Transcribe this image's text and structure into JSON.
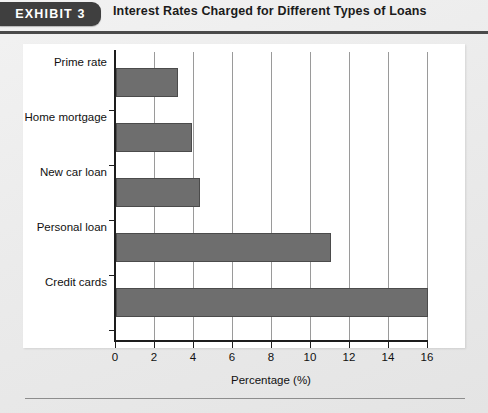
{
  "header": {
    "badge_label": "EXHIBIT 3",
    "title": "Interest Rates Charged for Different Types of Loans"
  },
  "colors": {
    "badge_background": "#3f3f3f",
    "badge_text": "#ffffff",
    "bar_fill": "#6e6e6e",
    "bar_stroke": "#4b4b4b",
    "gridline": "#9a9a9a",
    "axis": "#1d1d1d",
    "panel_background": "#ffffff",
    "page_background": "#ebebeb"
  },
  "chart_data": {
    "type": "bar",
    "orientation": "horizontal",
    "title": "Interest Rates Charged for Different Types of Loans",
    "categories": [
      "Prime rate",
      "Home mortgage",
      "New car loan",
      "Personal loan",
      "Credit cards"
    ],
    "values": [
      3.2,
      3.9,
      4.3,
      11.0,
      16.0
    ],
    "xlabel": "Percentage (%)",
    "ylabel": "",
    "xlim": [
      0,
      16
    ],
    "xticks": [
      0,
      2,
      4,
      6,
      8,
      10,
      12,
      14,
      16
    ],
    "xticklabels": [
      "0",
      "2",
      "4",
      "6",
      "8",
      "10",
      "12",
      "14",
      "16"
    ],
    "grid": "vertical",
    "legend": "none"
  }
}
